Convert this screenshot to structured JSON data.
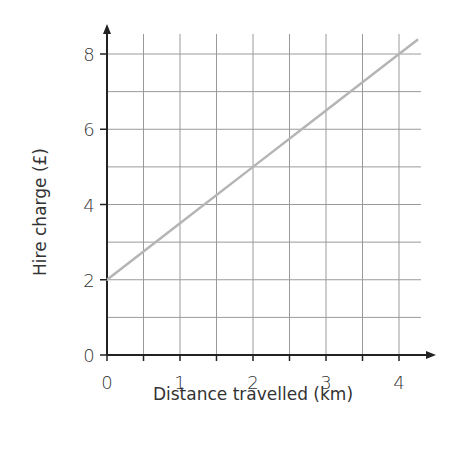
{
  "chart_data": {
    "type": "line",
    "title": "",
    "xlabel": "Distance travelled (km)",
    "ylabel": "Hire charge (£)",
    "xlim": [
      0,
      4.3
    ],
    "ylim": [
      0,
      8.4
    ],
    "x_ticks": [
      0,
      1,
      2,
      3,
      4
    ],
    "x_tick_labels": [
      "0",
      "1",
      "2",
      "3",
      "4"
    ],
    "y_ticks": [
      0,
      2,
      4,
      6,
      8
    ],
    "y_tick_labels": [
      "0",
      "2",
      "4",
      "6",
      "8"
    ],
    "grid": true,
    "grid_x_step": 0.5,
    "grid_y_step": 1,
    "legend": null,
    "series": [
      {
        "name": "Hire charge",
        "color": "#b5b5b5",
        "x": [
          0,
          1,
          2,
          3,
          4,
          4.25
        ],
        "y": [
          2,
          3.5,
          5,
          6.5,
          8,
          8.375
        ]
      }
    ]
  },
  "colors": {
    "axis": "#222222",
    "grid": "#9a9a9a",
    "line": "#b5b5b5",
    "text": "#333333"
  }
}
